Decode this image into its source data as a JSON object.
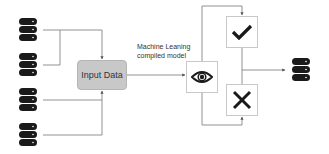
{
  "diagram": {
    "sources": [
      {
        "id": "db-1",
        "icon": "database-icon"
      },
      {
        "id": "db-2",
        "icon": "database-icon"
      },
      {
        "id": "db-3",
        "icon": "database-icon"
      },
      {
        "id": "db-4",
        "icon": "database-icon"
      }
    ],
    "input_node": {
      "label": "Input Data",
      "fill": "#c8c8c8"
    },
    "model_label": {
      "line1": "Machine Leaning",
      "line2": "compiled model"
    },
    "model_node": {
      "icon": "eye-icon"
    },
    "outcomes": [
      {
        "id": "accept",
        "icon": "check-icon"
      },
      {
        "id": "reject",
        "icon": "x-icon"
      }
    ],
    "output": {
      "icon": "database-icon"
    },
    "colors": {
      "line": "#555555",
      "icon": "#1a1a1a",
      "box_border": "#c9c9c9"
    }
  }
}
